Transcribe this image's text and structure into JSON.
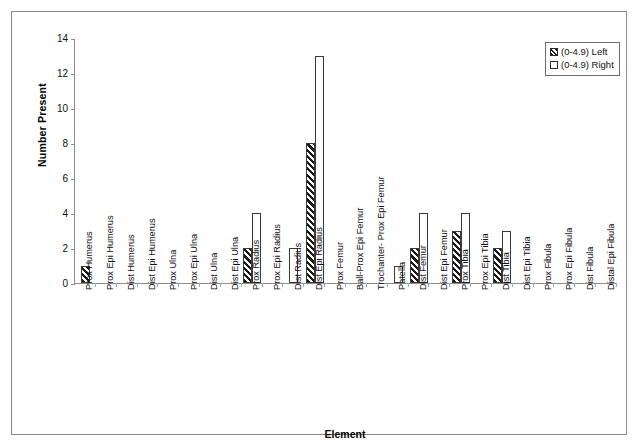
{
  "chart_data": {
    "type": "bar",
    "title": "",
    "xlabel": "Element",
    "ylabel": "Number Present",
    "ylim": [
      0,
      14
    ],
    "yticks": [
      0,
      2,
      4,
      6,
      8,
      10,
      12,
      14
    ],
    "grid": false,
    "legend_position": "top-right",
    "legend": [
      "(0-4.9) Left",
      "(0-4.9) Right"
    ],
    "categories": [
      "Prox Humerus",
      "Prox Epi Humerus",
      "Dist Humerus",
      "Dist Epi Humerus",
      "Prox Ulna",
      "Prox Epi Ulna",
      "Dist Ulna",
      "Dist Epi Ulna",
      "Prox Radius",
      "Prox Epi Radius",
      "Dist Radius",
      "Dist Epi Radius",
      "Prox Femur",
      "Ball-Prox Epi Femur",
      "Trochanter- Prox Epi Femur",
      "Patella",
      "Dist Femur",
      "Dist Epi Femur",
      "Prox Tibia",
      "Prox Epi Tibia",
      "Dist Tibia",
      "Dist Epi Tibia",
      "Prox Fibula",
      "Prox Epi Fibula",
      "Dist Fibula",
      "Distal Epi Fibula"
    ],
    "series": [
      {
        "name": "(0-4.9) Left",
        "pattern": "diagonal-hatch",
        "values": [
          1,
          0,
          0,
          0,
          0,
          0,
          0,
          0,
          2,
          0,
          0,
          8,
          0,
          0,
          0,
          0,
          2,
          0,
          3,
          0,
          2,
          0,
          0,
          0,
          0,
          0
        ]
      },
      {
        "name": "(0-4.9) Right",
        "pattern": "dotted",
        "values": [
          0,
          0,
          0,
          0,
          0,
          0,
          0,
          0,
          4,
          0,
          2,
          13,
          0,
          0,
          0,
          1,
          4,
          0,
          4,
          0,
          3,
          0,
          0,
          0,
          0,
          0
        ]
      }
    ]
  }
}
